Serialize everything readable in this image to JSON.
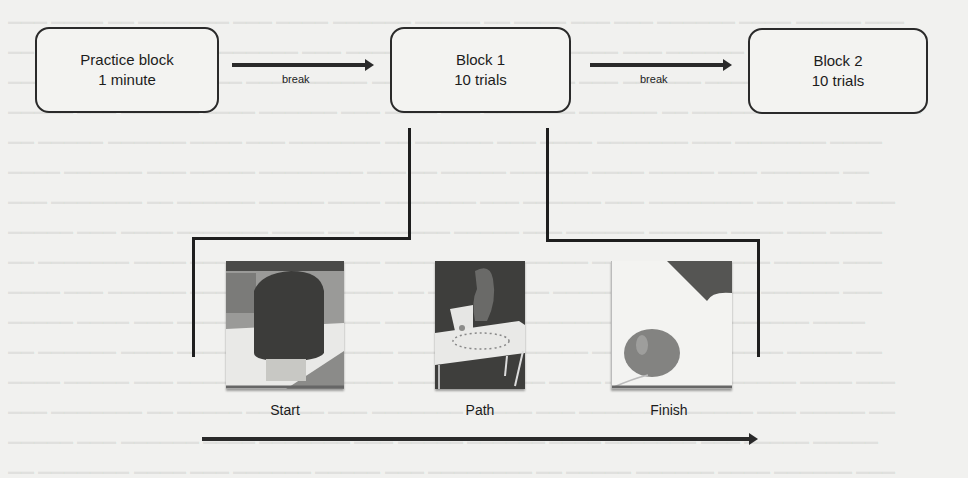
{
  "diagram": {
    "blocks": [
      {
        "id": "practice",
        "line1": "Practice block",
        "line2": "1 minute"
      },
      {
        "id": "block1",
        "line1": "Block 1",
        "line2": "10 trials"
      },
      {
        "id": "block2",
        "line1": "Block 2",
        "line2": "10 trials"
      }
    ],
    "transitions": [
      {
        "from": "practice",
        "to": "block1",
        "label": "break"
      },
      {
        "from": "block1",
        "to": "block2",
        "label": "break"
      }
    ],
    "trial_expansion": {
      "of_block": "block1",
      "stages": [
        {
          "label": "Start",
          "image": "robot-arm-closeup"
        },
        {
          "label": "Path",
          "image": "robot-arm-table-with-dotted-path"
        },
        {
          "label": "Finish",
          "image": "balloon"
        }
      ],
      "timeline_arrow": "left-to-right"
    },
    "colors": {
      "background": "#f1f1ef",
      "stroke": "#2a2a2a",
      "text": "#1c1c1c"
    }
  }
}
